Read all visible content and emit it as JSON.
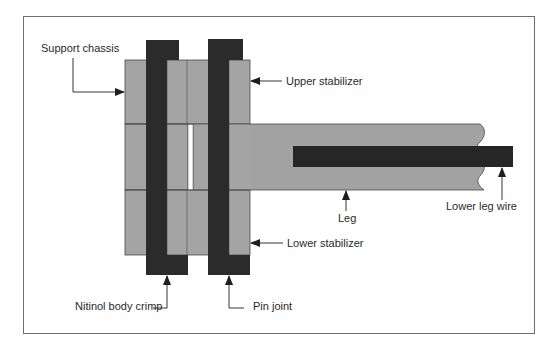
{
  "figure": {
    "type": "mechanical schematic",
    "colors": {
      "frame": "#6e6e6e",
      "chassis_fill": "#a4a4a4",
      "leg_fill": "#a2a2a2",
      "pin_fill": "#2b2b2b",
      "wire_fill": "#262626",
      "outline": "#4a4a4a",
      "text": "#2a2a2a"
    }
  },
  "labels": {
    "support_chassis": "Support chassis",
    "upper_stabilizer": "Upper stabilizer",
    "lower_stabilizer": "Lower stabilizer",
    "leg": "Leg",
    "lower_leg_wire": "Lower leg wire",
    "nitinol_body_crimp": "Nitinol body crimp",
    "pin_joint": "Pin joint"
  }
}
